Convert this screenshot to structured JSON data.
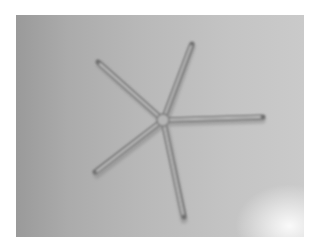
{
  "image": {
    "subject": "starfish",
    "description": "Grayscale photo of a thin five-armed starfish (brittle star shape) on a gray surface",
    "arms": 5,
    "colors": {
      "border": "#ffffff",
      "background_dark": "#9a9a9a",
      "background_light": "#cacaca",
      "arm_shadow": "#6e6e6e",
      "arm_highlight": "#d8d8d8"
    }
  }
}
